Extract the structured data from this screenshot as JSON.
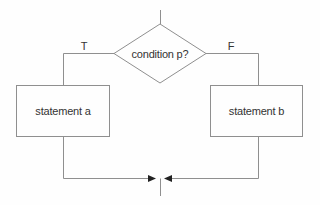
{
  "flowchart": {
    "condition_label": "condition p?",
    "true_branch_label": "T",
    "false_branch_label": "F",
    "true_node_label": "statement a",
    "false_node_label": "statement b",
    "colors": {
      "line": "#8f8f8f",
      "arrow": "#222222",
      "text": "#333333",
      "background": "#fefefe"
    }
  }
}
